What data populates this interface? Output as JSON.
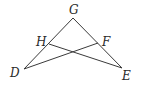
{
  "diagram": {
    "type": "geometry",
    "points": {
      "G": {
        "label": "G",
        "x": 73,
        "y": 18,
        "lx": 69,
        "ly": 14
      },
      "H": {
        "label": "H",
        "x": 49,
        "y": 44,
        "lx": 36,
        "ly": 46
      },
      "F": {
        "label": "F",
        "x": 98,
        "y": 43,
        "lx": 102,
        "ly": 46
      },
      "D": {
        "label": "D",
        "x": 24,
        "y": 69,
        "lx": 10,
        "ly": 77
      },
      "E": {
        "label": "E",
        "x": 122,
        "y": 68,
        "lx": 122,
        "ly": 80
      }
    },
    "segments": [
      {
        "from": "G",
        "to": "D"
      },
      {
        "from": "G",
        "to": "E"
      },
      {
        "from": "H",
        "to": "E"
      },
      {
        "from": "F",
        "to": "D"
      }
    ],
    "stroke_color": "#3a3a3a"
  }
}
